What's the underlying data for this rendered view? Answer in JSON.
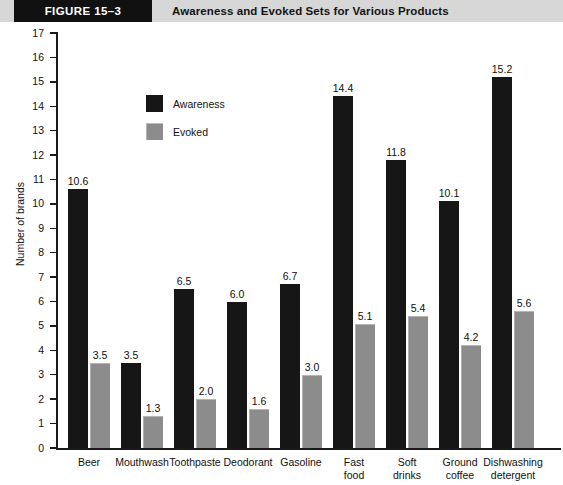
{
  "header": {
    "figure_tag": "FIGURE  15–3",
    "title": "Awareness and Evoked Sets for Various Products"
  },
  "legend": {
    "position": "inside-top-left",
    "items": [
      {
        "label": "Awareness",
        "color": "#161616",
        "icon": "square-swatch-icon"
      },
      {
        "label": "Evoked",
        "color": "#8c8c8c",
        "icon": "square-swatch-icon"
      }
    ]
  },
  "chart_data": {
    "type": "bar",
    "title": "Awareness and Evoked Sets for Various Products",
    "xlabel": "",
    "ylabel": "Number of brands",
    "ylim": [
      0,
      17
    ],
    "ytick_step": 1,
    "yticks": [
      "17",
      "16",
      "15",
      "14",
      "13",
      "12",
      "11",
      "10",
      "9",
      "8",
      "7",
      "6",
      "5",
      "4",
      "3",
      "2",
      "1",
      "0"
    ],
    "grid": false,
    "legend_position": "inside-top-left",
    "categories": [
      "Beer",
      "Mouthwash",
      "Toothpaste",
      "Deodorant",
      "Gasoline",
      "Fast\nfood",
      "Soft\ndrinks",
      "Ground\ncoffee",
      "Dishwashing\ndetergent"
    ],
    "series": [
      {
        "name": "Awareness",
        "color": "#161616",
        "values": [
          10.6,
          3.5,
          6.5,
          6.0,
          6.7,
          14.4,
          11.8,
          10.1,
          15.2
        ],
        "labels": [
          "10.6",
          "3.5",
          "6.5",
          "6.0",
          "6.7",
          "14.4",
          "11.8",
          "10.1",
          "15.2"
        ]
      },
      {
        "name": "Evoked",
        "color": "#8c8c8c",
        "values": [
          3.5,
          1.3,
          2.0,
          1.6,
          3.0,
          5.1,
          5.4,
          4.2,
          5.6
        ],
        "labels": [
          "3.5",
          "1.3",
          "2.0",
          "1.6",
          "3.0",
          "5.1",
          "5.4",
          "4.2",
          "5.6"
        ]
      }
    ]
  },
  "colors": {
    "header_band": "#d7d7d7",
    "header_tag_bg": "#111111",
    "awareness": "#161616",
    "evoked": "#8c8c8c",
    "axis": "#1a1a1a"
  }
}
